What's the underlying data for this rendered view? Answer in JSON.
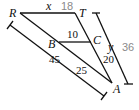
{
  "diagram": {
    "points": {
      "R": {
        "label": "R",
        "x": 20,
        "y": 13
      },
      "T": {
        "label": "T",
        "x": 75,
        "y": 13
      },
      "B": {
        "label": "B",
        "x": 59,
        "y": 42
      },
      "C": {
        "label": "C",
        "x": 91,
        "y": 42
      },
      "A": {
        "label": "A",
        "x": 112,
        "y": 83
      }
    },
    "segments": [
      {
        "from": "R",
        "to": "T",
        "label": "x"
      },
      {
        "from": "B",
        "to": "C",
        "label": "10"
      },
      {
        "from": "R",
        "to": "A"
      },
      {
        "from": "T",
        "to": "A"
      },
      {
        "from": "B",
        "to": "A",
        "label": "25"
      },
      {
        "from": "C",
        "to": "A",
        "label": "20"
      }
    ],
    "dimension_lines": [
      {
        "name": "RA-measure",
        "label": "45"
      },
      {
        "name": "TA-measure",
        "label": "y"
      }
    ],
    "labels": {
      "R": "R",
      "T": "T",
      "B": "B",
      "C": "C",
      "A": "A",
      "x": "x",
      "ten": "10",
      "twentyfive": "25",
      "twenty": "20",
      "fortyfive": "45",
      "y": "y"
    },
    "answers": {
      "x_value": "18",
      "y_value": "36"
    },
    "colors": {
      "line": "#111111",
      "answer_text": "#8a8a8a"
    }
  }
}
